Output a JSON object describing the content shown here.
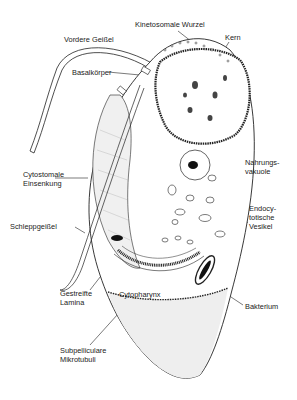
{
  "diagram": {
    "labels": [
      {
        "id": "kinetosomale-wurzel",
        "text": "Kinetosomale Wurzel",
        "x": 135,
        "y": 20
      },
      {
        "id": "kern",
        "text": "Kern",
        "x": 225,
        "y": 33
      },
      {
        "id": "vordere-geissel",
        "text": "Vordere Geißel",
        "x": 64,
        "y": 35
      },
      {
        "id": "basalkoerper",
        "text": "Basalkörper",
        "x": 72,
        "y": 68
      },
      {
        "id": "nahrungsvakuole",
        "text": "Nahrungs-\nvakuole",
        "x": 245,
        "y": 158
      },
      {
        "id": "cytostomale-einsenkung",
        "text": "Cytostomale\nEinsenkung",
        "x": 23,
        "y": 170
      },
      {
        "id": "endocytotische-vesikel",
        "text": "Endocy-\ntotische\nVesikel",
        "x": 249,
        "y": 204
      },
      {
        "id": "schleppgeissel",
        "text": "Schleppgeißel",
        "x": 10,
        "y": 222
      },
      {
        "id": "gestreifte-lamina",
        "text": "Gestreifte\nLamina",
        "x": 60,
        "y": 289
      },
      {
        "id": "cytopharynx",
        "text": "Cytopharynx",
        "x": 119,
        "y": 290
      },
      {
        "id": "bakterium",
        "text": "Bakterium",
        "x": 245,
        "y": 302
      },
      {
        "id": "subpelliculare-mikrotubuli",
        "text": "Subpelliculare\nMikrotubuli",
        "x": 60,
        "y": 346
      }
    ],
    "colors": {
      "line": "#222222",
      "fill_light": "#eeeeee",
      "fill_shade": "#d8d8d8",
      "dark": "#111111",
      "background": "#ffffff"
    }
  }
}
